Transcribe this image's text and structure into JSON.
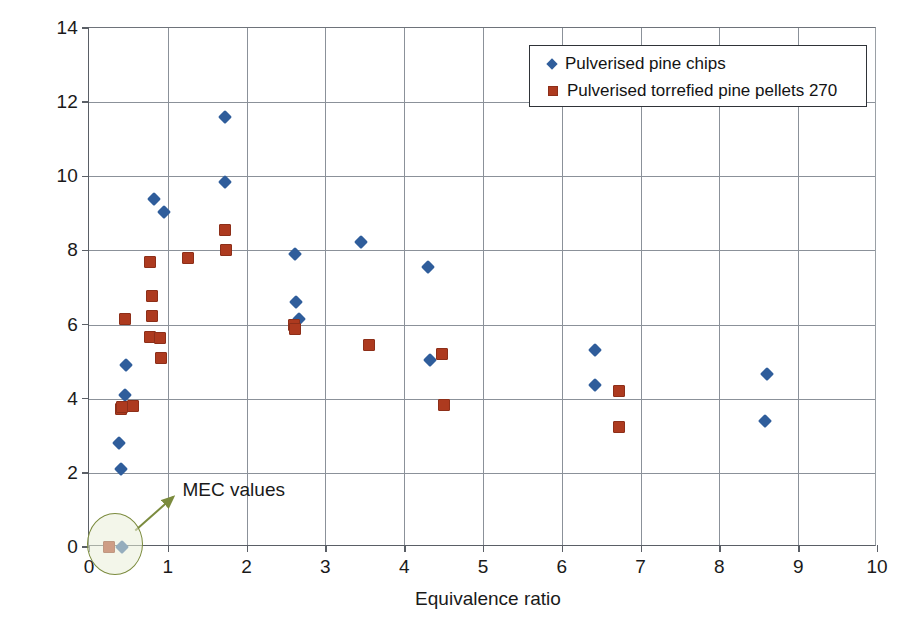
{
  "chart_data": {
    "type": "scatter",
    "title": "",
    "xlabel": "Equivalence ratio",
    "ylabel": "Average velocity (m/s)",
    "xlim": [
      0,
      10
    ],
    "ylim": [
      0,
      14
    ],
    "xticks": [
      "0",
      "1",
      "2",
      "3",
      "4",
      "5",
      "6",
      "7",
      "8",
      "9",
      "10"
    ],
    "yticks": [
      "0",
      "2",
      "4",
      "6",
      "8",
      "10",
      "12",
      "14"
    ],
    "grid": true,
    "legend_position": "top-right",
    "series": [
      {
        "name": "Pulverised pine chips",
        "marker": "diamond",
        "color": "#2f5d9b",
        "points": [
          [
            0.42,
            0.0
          ],
          [
            0.4,
            2.1
          ],
          [
            0.38,
            2.8
          ],
          [
            0.46,
            4.1
          ],
          [
            0.47,
            4.9
          ],
          [
            0.82,
            9.4
          ],
          [
            0.95,
            9.05
          ],
          [
            1.72,
            11.6
          ],
          [
            1.73,
            9.85
          ],
          [
            2.62,
            7.9
          ],
          [
            2.63,
            6.6
          ],
          [
            2.66,
            6.15
          ],
          [
            3.45,
            8.22
          ],
          [
            4.3,
            7.56
          ],
          [
            4.33,
            5.05
          ],
          [
            6.42,
            5.32
          ],
          [
            6.42,
            4.37
          ],
          [
            8.6,
            4.68
          ],
          [
            8.58,
            3.4
          ]
        ]
      },
      {
        "name": "Pulverised torrefied pine pellets 270",
        "marker": "square",
        "color": "#ad3a1f",
        "points": [
          [
            0.25,
            0.0
          ],
          [
            0.4,
            3.72
          ],
          [
            0.42,
            3.78
          ],
          [
            0.56,
            3.8
          ],
          [
            0.46,
            6.15
          ],
          [
            0.78,
            7.68
          ],
          [
            0.8,
            6.78
          ],
          [
            0.8,
            6.24
          ],
          [
            0.78,
            5.66
          ],
          [
            0.9,
            5.64
          ],
          [
            0.92,
            5.1
          ],
          [
            1.26,
            7.8
          ],
          [
            1.73,
            8.55
          ],
          [
            1.74,
            8.02
          ],
          [
            2.6,
            6.0
          ],
          [
            2.62,
            5.88
          ],
          [
            3.55,
            5.44
          ],
          [
            4.48,
            5.2
          ],
          [
            4.5,
            3.82
          ],
          [
            6.72,
            4.2
          ],
          [
            6.72,
            3.25
          ]
        ]
      }
    ],
    "annotations": [
      {
        "label": "MEC values",
        "text_x": 1.2,
        "text_y": 1.45,
        "ellipse_center_x": 0.34,
        "ellipse_center_y": 0.05,
        "arrow_from_x": 0.6,
        "arrow_from_y": 0.42,
        "arrow_to_x": 1.08,
        "arrow_to_y": 1.32
      }
    ]
  },
  "colors": {
    "series_1": "#2f5d9b",
    "series_2": "#ad3a1f",
    "gridline": "#8b9199",
    "axis": "#5a5f66",
    "annotation": "#7b8b3e",
    "text": "#1a1a1a"
  }
}
